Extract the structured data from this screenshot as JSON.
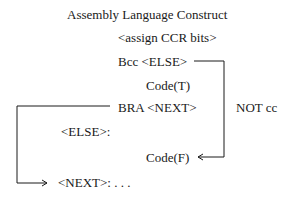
{
  "title": "Assembly Language Construct",
  "lines": {
    "assign": "<assign CCR bits>",
    "bcc": "Bcc <ELSE>",
    "code_t": "Code(T)",
    "bra": "BRA <NEXT>",
    "else_label": "<ELSE>:",
    "code_f": "Code(F)",
    "next_label": "<NEXT>:  . . ."
  },
  "annotations": {
    "not_cc": "NOT cc"
  }
}
